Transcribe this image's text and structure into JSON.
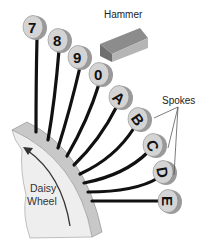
{
  "labels": {
    "hammer": "Hammer",
    "spokes": "Spokes",
    "wheel_line1": "Daisy",
    "wheel_line2": "Wheel"
  },
  "characters": [
    "7",
    "8",
    "9",
    "0",
    "A",
    "B",
    "C",
    "D",
    "E"
  ],
  "colors": {
    "disc_face": "#d4d4d4",
    "disc_edge": "#9a9a9a",
    "spoke": "#111111",
    "wheel_face": "#eeeeee",
    "wheel_rim": "#c8c8c8",
    "hammer_top": "#8c8c8c",
    "hammer_side": "#b5b5b5"
  }
}
